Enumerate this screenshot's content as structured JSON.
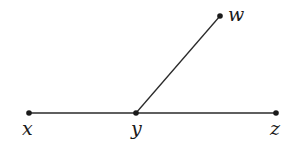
{
  "diagram": {
    "type": "geometry-angle",
    "colors": {
      "line": "#2a2a2a",
      "point": "#1a1a1a",
      "label": "#1a1a1a"
    },
    "points": [
      {
        "id": "x",
        "label": "x",
        "cx": 29,
        "cy": 113,
        "lx": 22,
        "ly": 135
      },
      {
        "id": "y",
        "label": "y",
        "cx": 136,
        "cy": 113,
        "lx": 131,
        "ly": 135
      },
      {
        "id": "z",
        "label": "z",
        "cx": 276,
        "cy": 113,
        "lx": 270,
        "ly": 135
      },
      {
        "id": "w",
        "label": "w",
        "cx": 220,
        "cy": 16,
        "lx": 228,
        "ly": 21
      }
    ],
    "segments": [
      {
        "from": "x",
        "to": "z"
      },
      {
        "from": "y",
        "to": "w"
      }
    ]
  }
}
